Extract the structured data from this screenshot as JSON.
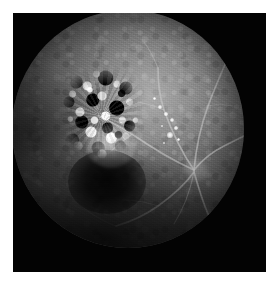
{
  "figure": {
    "type": "fundus-fluorescein-angiogram",
    "modality_label": "Fluorescein angiography",
    "eye_view_label": "Retinal fundus",
    "caption": "",
    "canvas": {
      "width_px": 280,
      "height_px": 289,
      "background_color": "#ffffff"
    },
    "frame": {
      "left_px": 13,
      "top_px": 13,
      "width_px": 253,
      "height_px": 259,
      "background_color": "#030303",
      "label": "photographic frame"
    }
  },
  "fundus": {
    "label": "fundus disc",
    "center_x_px": 128,
    "center_y_px": 129,
    "diameter_px": 232,
    "background_color": "#636363",
    "rim_color": "#050505",
    "brightest_color": "#b0b0b0",
    "darkest_color": "#000000"
  },
  "features": [
    {
      "name": "hyperfluorescent-lesion",
      "label": "Mottled hyper/hypofluorescent lesion",
      "position": "superotemporal to macula",
      "left_px": 44,
      "top_px": 56,
      "width_px": 92,
      "height_px": 100,
      "appearance": "coarse black-and-white speckled mottling"
    },
    {
      "name": "macula",
      "label": "Dark macula / foveal shadow",
      "position": "inferior to lesion",
      "left_px": 56,
      "top_px": 140,
      "width_px": 78,
      "height_px": 64,
      "appearance": "hypofluorescent dark patch"
    },
    {
      "name": "optic-disc",
      "label": "Optic disc",
      "position": "right of centre",
      "left_px": 170,
      "top_px": 148,
      "width_px": 26,
      "height_px": 24,
      "appearance": "faint bright disc with radiating vessels"
    },
    {
      "name": "vascular-arcades",
      "label": "Retinal vascular arcades",
      "position": "radiating from optic disc",
      "appearance": "thin bright branching vessels"
    },
    {
      "name": "satellite-hyperfluorescent-dots",
      "label": "Satellite hyperfluorescent dots",
      "position": "between lesion and optic disc",
      "count": 9
    }
  ],
  "satellite_dots": [
    {
      "x": 148,
      "y": 97,
      "r": 2.0
    },
    {
      "x": 154,
      "y": 104,
      "r": 1.6
    },
    {
      "x": 160,
      "y": 110,
      "r": 2.4
    },
    {
      "x": 150,
      "y": 116,
      "r": 1.4
    },
    {
      "x": 164,
      "y": 118,
      "r": 1.8
    },
    {
      "x": 158,
      "y": 125,
      "r": 2.6
    },
    {
      "x": 166,
      "y": 129,
      "r": 1.5
    },
    {
      "x": 152,
      "y": 133,
      "r": 1.3
    },
    {
      "x": 142,
      "y": 88,
      "r": 1.5
    }
  ],
  "vessels": {
    "stroke_color": "#c9c9c9",
    "paths": [
      "M182,160 C160,150 140,138 120,124 C108,116 96,110 86,106",
      "M182,160 C168,140 160,122 152,100 C148,88 146,74 146,58",
      "M182,160 C184,138 188,118 196,96 C202,80 208,66 214,52",
      "M182,160 C190,150 200,142 212,136 C224,130 232,126 240,122",
      "M182,162 C186,176 190,190 196,204 C202,216 208,226 214,236",
      "M182,162 C172,176 160,186 146,196 C132,206 118,212 104,216",
      "M182,162 C178,182 172,198 162,214",
      "M146,58 C142,48 138,40 132,32",
      "M152,100 C144,96 136,94 126,92",
      "M120,124 C112,130 104,136 96,144",
      "M146,196 C134,192 122,190 110,190",
      "M104,216 C92,212 82,206 72,198",
      "M214,236 C206,242 196,246 186,248",
      "M196,96 C204,94 212,94 220,96",
      "M86,106 C76,102 66,100 56,100"
    ]
  },
  "colors": {
    "page_background": "#ffffff",
    "frame_black": "#030303",
    "retina_mid_gray": "#636363",
    "retina_bright": "#b0b0b0",
    "lesion_white": "#ffffff",
    "lesion_black": "#000000",
    "vessel_gray": "#c9c9c9"
  }
}
